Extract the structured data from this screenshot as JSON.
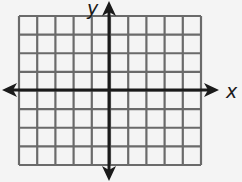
{
  "diagram": {
    "type": "coordinate-plane",
    "x_axis_label": "x",
    "y_axis_label": "y",
    "grid": {
      "columns": 10,
      "rows": 8,
      "left": 19,
      "top": 16,
      "right": 201,
      "bottom": 165,
      "line_color": "#6a6a6a"
    },
    "axes": {
      "origin_x": 109,
      "origin_y": 90,
      "color": "#1a1a1a",
      "x_arrow_left": 2,
      "x_arrow_right": 219,
      "y_arrow_top": 1,
      "y_arrow_bottom": 181
    },
    "background": "#f4f4f4"
  }
}
